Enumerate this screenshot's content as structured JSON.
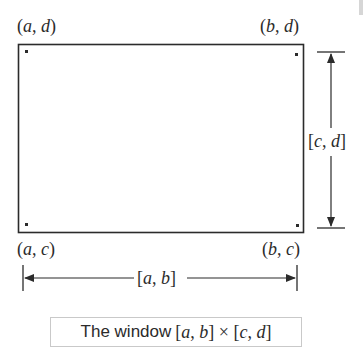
{
  "figure": {
    "type": "window-diagram",
    "colors": {
      "stroke": "#2b2b2b",
      "caption_border": "#c9c9c9",
      "background": "#ffffff"
    },
    "corners": {
      "top_left": {
        "open": "(",
        "x": "a",
        "sep": ", ",
        "y": "d",
        "close": ")"
      },
      "top_right": {
        "open": "(",
        "x": "b",
        "sep": ", ",
        "y": "d",
        "close": ")"
      },
      "bottom_left": {
        "open": "(",
        "x": "a",
        "sep": ", ",
        "y": "c",
        "close": ")"
      },
      "bottom_right": {
        "open": "(",
        "x": "b",
        "sep": ", ",
        "y": "c",
        "close": ")"
      }
    },
    "horizontal_interval": {
      "open": "[",
      "lo": "a",
      "sep": ", ",
      "hi": "b",
      "close": "]"
    },
    "vertical_interval": {
      "open": "[",
      "lo": "c",
      "sep": ", ",
      "hi": "d",
      "close": "]"
    },
    "caption": {
      "prefix": "The window ",
      "interval1": {
        "open": "[",
        "lo": "a",
        "sep": ", ",
        "hi": "b",
        "close": "]"
      },
      "times": " × ",
      "interval2": {
        "open": "[",
        "lo": "c",
        "sep": ", ",
        "hi": "d",
        "close": "]"
      }
    }
  }
}
